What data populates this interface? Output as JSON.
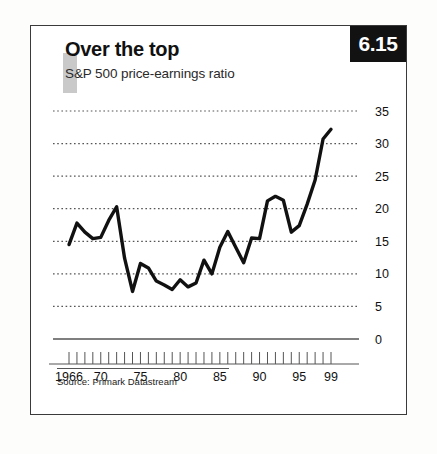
{
  "badge": {
    "number": "6.15"
  },
  "header": {
    "title": "Over the top",
    "subtitle": "S&P 500 price-earnings ratio"
  },
  "footer": {
    "source": "Source: Primark Datastream"
  },
  "colors": {
    "line": "#111111",
    "gridline": "#555555",
    "axis": "#555555",
    "badge_bg": "#121212",
    "badge_text": "#ffffff",
    "frame": "#3a3a3a",
    "accent_square": "#c9c9c9"
  },
  "chart_data": {
    "type": "line",
    "title": "Over the top",
    "subtitle": "S&P 500 price-earnings ratio",
    "xlabel": "",
    "ylabel": "",
    "ylim": [
      0,
      35
    ],
    "xlim": [
      1966,
      1999
    ],
    "grid": true,
    "legend": "none",
    "yticks": [
      0,
      5,
      10,
      15,
      20,
      25,
      30,
      35
    ],
    "ytick_labels": [
      "0",
      "5",
      "10",
      "15",
      "20",
      "25",
      "30",
      "35"
    ],
    "xtick_labels": [
      "1966",
      "70",
      "75",
      "80",
      "85",
      "90",
      "95",
      "99"
    ],
    "xtick_label_years": [
      1966,
      1970,
      1975,
      1980,
      1985,
      1990,
      1995,
      1999
    ],
    "minor_xticks_every_year": true,
    "x": [
      1966,
      1967,
      1968,
      1969,
      1970,
      1971,
      1972,
      1973,
      1974,
      1975,
      1976,
      1977,
      1978,
      1979,
      1980,
      1981,
      1982,
      1983,
      1984,
      1985,
      1986,
      1987,
      1988,
      1989,
      1990,
      1991,
      1992,
      1993,
      1994,
      1995,
      1996,
      1997,
      1998,
      1999
    ],
    "series": [
      {
        "name": "S&P 500 price-earnings ratio",
        "values": [
          14.5,
          17.8,
          16.4,
          15.4,
          15.6,
          18.2,
          20.3,
          12.4,
          7.3,
          11.6,
          10.9,
          8.9,
          8.3,
          7.6,
          9.1,
          8.0,
          8.6,
          12.1,
          10.0,
          14.1,
          16.5,
          14.1,
          11.7,
          15.5,
          15.4,
          21.2,
          21.9,
          21.3,
          16.4,
          17.4,
          20.7,
          24.4,
          30.7,
          32.2
        ]
      }
    ],
    "annotations": []
  }
}
